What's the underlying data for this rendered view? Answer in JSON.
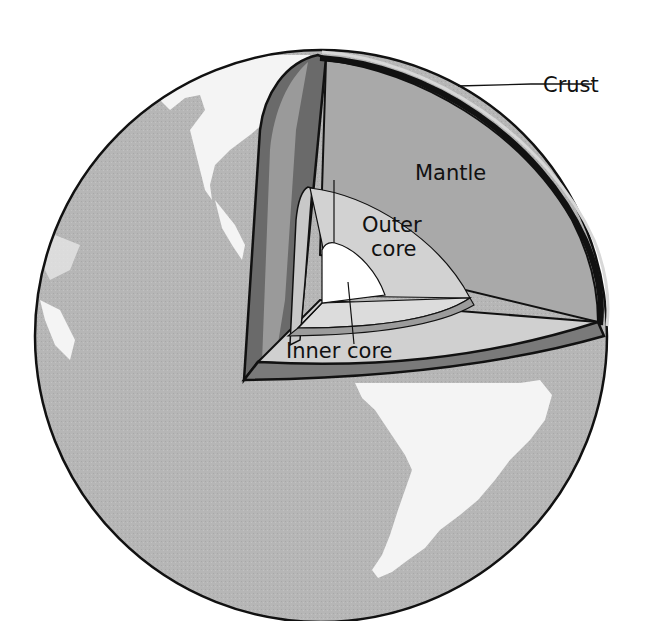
{
  "diagram": {
    "labels": {
      "crust": "Crust",
      "mantle": "Mantle",
      "outer_core_line1": "Outer",
      "outer_core_line2": "core",
      "inner_core": "Inner core"
    },
    "layers": [
      "Crust",
      "Mantle",
      "Outer core",
      "Inner core"
    ],
    "colors": {
      "background": "#ffffff",
      "ocean": "#b4b4b4",
      "land": "#f2f2f2",
      "crust": "#7a7a7a",
      "mantle_top": "#a9a9a9",
      "mantle_side": "#6c6c6c",
      "outer_core": "#d2d2d2",
      "inner_core": "#ffffff",
      "outline": "#111111"
    }
  }
}
